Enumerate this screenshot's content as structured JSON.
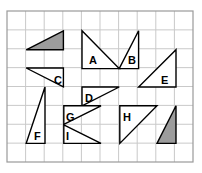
{
  "figure": {
    "grid": {
      "x": 7,
      "y": 11,
      "width": 186,
      "height": 151,
      "columns": 10,
      "rows": 8,
      "cell_width": 18.6,
      "cell_height": 18.875,
      "line_color": "#c9c9c9",
      "border_color": "#9a9a9a"
    },
    "style": {
      "outline_color": "#000000",
      "outline_width": 1.4,
      "shaded_fill": "#9c9c9c",
      "unshaded_fill": "#ffffff",
      "background": "#ffffff"
    },
    "shapes": [
      {
        "id": "shaded-top-left",
        "label": "",
        "shaded": true,
        "points": "26.2,49.8 63.4,49.8 63.4,31.0",
        "label_x": 0,
        "label_y": 0
      },
      {
        "id": "triangle-a",
        "label": "A",
        "shaded": false,
        "points": "82.0,30.8 82.0,68.6 119.2,68.6",
        "label_x": 89,
        "label_y": 64
      },
      {
        "id": "triangle-b",
        "label": "B",
        "shaded": false,
        "points": "119.2,68.6 138.6,30.8 138.6,68.6",
        "label_x": 128,
        "label_y": 64
      },
      {
        "id": "triangle-c",
        "label": "C",
        "shaded": false,
        "points": "26.2,68.0 63.4,68.0 63.4,86.8",
        "label_x": 54,
        "label_y": 84
      },
      {
        "id": "triangle-d",
        "label": "D",
        "shaded": false,
        "points": "82.0,87.0 119.2,87.0 82.0,105.8",
        "label_x": 85,
        "label_y": 102
      },
      {
        "id": "triangle-e",
        "label": "E",
        "shaded": false,
        "points": "138.6,87.0 176.0,87.0 176.0,49.8",
        "label_x": 161,
        "label_y": 84
      },
      {
        "id": "triangle-f",
        "label": "F",
        "shaded": false,
        "points": "45.0,87.0 45.0,143.4 26.2,143.4",
        "label_x": 34,
        "label_y": 140
      },
      {
        "id": "triangle-g",
        "label": "G",
        "shaded": false,
        "points": "63.8,105.8 101.0,105.8 63.8,124.4",
        "label_x": 66,
        "label_y": 121
      },
      {
        "id": "triangle-h",
        "label": "H",
        "shaded": false,
        "points": "119.8,105.8 157.0,105.8 119.8,143.4",
        "label_x": 123,
        "label_y": 121
      },
      {
        "id": "triangle-i",
        "label": "I",
        "shaded": false,
        "points": "63.8,124.8 101.0,143.4 63.8,143.4",
        "label_x": 66,
        "label_y": 140
      },
      {
        "id": "shaded-bottom-right",
        "label": "",
        "shaded": true,
        "points": "157.0,143.4 176.0,105.8 176.0,143.4",
        "label_x": 0,
        "label_y": 0
      }
    ]
  }
}
